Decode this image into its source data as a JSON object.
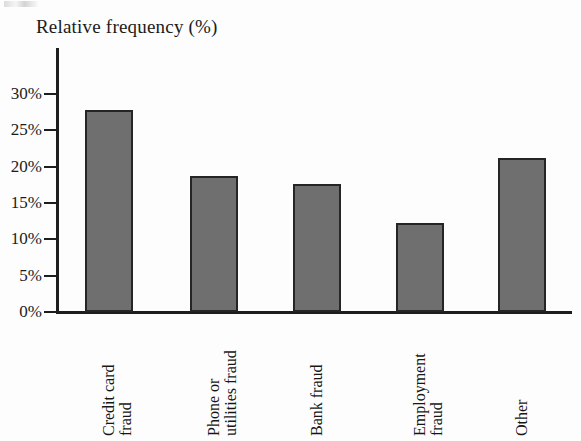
{
  "chart_data": {
    "type": "bar",
    "title": "Relative frequency (%)",
    "xlabel": "",
    "ylabel": "Relative frequency (%)",
    "categories": [
      "Credit card\nfraud",
      "Phone or\nutilities fraud",
      "Bank fraud",
      "Employment\nfraud",
      "Other"
    ],
    "category_labels_plain": [
      "Credit card fraud",
      "Phone or utilities fraud",
      "Bank fraud",
      "Employment fraud",
      "Other"
    ],
    "values": [
      27.8,
      18.7,
      17.6,
      12.3,
      21.2
    ],
    "ylim": [
      0,
      30
    ],
    "ytick_values": [
      0,
      5,
      10,
      15,
      20,
      25,
      30
    ],
    "ytick_labels": [
      "0%",
      "5%",
      "10%",
      "15%",
      "20%",
      "25%",
      "30%"
    ],
    "grid": false,
    "legend": null,
    "bar_fill_color": "#6f6f6f",
    "bar_edge_color": "#252525",
    "axis_color": "#1d1d1d",
    "background_color": "#fdfdfd"
  }
}
